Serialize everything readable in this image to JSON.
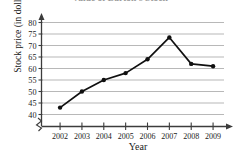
{
  "chart_data": {
    "type": "line",
    "title": "Value of Barton's Stock",
    "title_clipped": true,
    "xlabel": "Year",
    "ylabel": "Stock price (in dollars)",
    "categories": [
      "2002",
      "2003",
      "2004",
      "2005",
      "2006",
      "2007",
      "2008",
      "2009"
    ],
    "values": [
      43,
      50,
      55,
      58,
      64,
      73.5,
      62,
      61
    ],
    "series": [
      {
        "name": "Stock price",
        "values": [
          43,
          50,
          55,
          58,
          64,
          73.5,
          62,
          61
        ]
      }
    ],
    "ylim": [
      40,
      80
    ],
    "y_ticks": [
      40,
      45,
      50,
      55,
      60,
      65,
      70,
      75,
      80
    ],
    "y_tick_labels": [
      "40",
      "45",
      "50",
      "55",
      "60",
      "65",
      "70",
      "75",
      "80"
    ],
    "x_tick_labels": [
      "2002",
      "2003",
      "2004",
      "2005",
      "2006",
      "2007",
      "2008",
      "2009"
    ],
    "grid": "horizontal",
    "legend": "none",
    "axis_break": "y-axis broken below 40",
    "marker": "filled-circle",
    "line_color": "#101010",
    "grid_color": "#9a9a9a",
    "axis_color": "#3c3c3c",
    "background_color": "#ffffff"
  }
}
